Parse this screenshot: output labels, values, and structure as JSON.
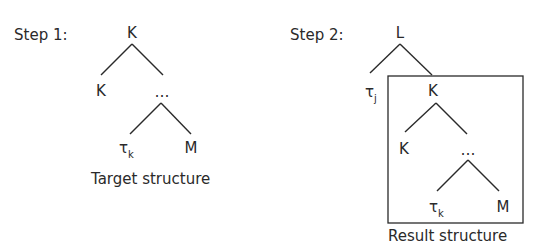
{
  "step1": {
    "label": "Step 1:",
    "caption": "Target structure",
    "nodes": {
      "root": "K",
      "left": "K",
      "right": "…",
      "leaf_left_base": "τ",
      "leaf_left_sub": "k",
      "leaf_right": "M"
    }
  },
  "step2": {
    "label": "Step 2:",
    "caption": "Result structure",
    "nodes": {
      "root": "L",
      "left_base": "τ",
      "left_sub": "j",
      "box_root": "K",
      "box_left": "K",
      "box_right": "…",
      "box_leaf_left_base": "τ",
      "box_leaf_left_sub": "k",
      "box_leaf_right": "M"
    }
  }
}
